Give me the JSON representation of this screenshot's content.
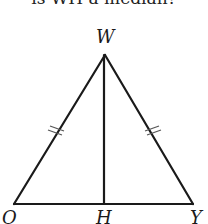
{
  "caption": "is WH a median?",
  "diagram": {
    "type": "isosceles-triangle",
    "vertices": {
      "apex": {
        "label": "W",
        "x": 105,
        "y": 55
      },
      "left": {
        "label": "O",
        "x": 14,
        "y": 204
      },
      "right": {
        "label": "Y",
        "x": 193,
        "y": 204
      }
    },
    "foot": {
      "label": "H",
      "x": 104,
      "y": 204
    },
    "segments": [
      "WO",
      "WY",
      "OY",
      "WH"
    ],
    "congruence_marks": {
      "WO": 2,
      "WY": 2
    },
    "stroke_color": "#1a1a1a"
  }
}
